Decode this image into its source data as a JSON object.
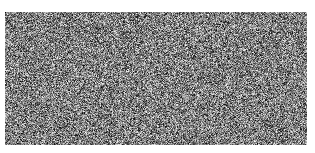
{
  "image": {
    "description": "grayscale random noise field",
    "background_color": "#ffffff",
    "noise": {
      "min_gray": 0,
      "max_gray": 255,
      "dominant_tone": "mid-gray",
      "seed": 12345
    }
  }
}
